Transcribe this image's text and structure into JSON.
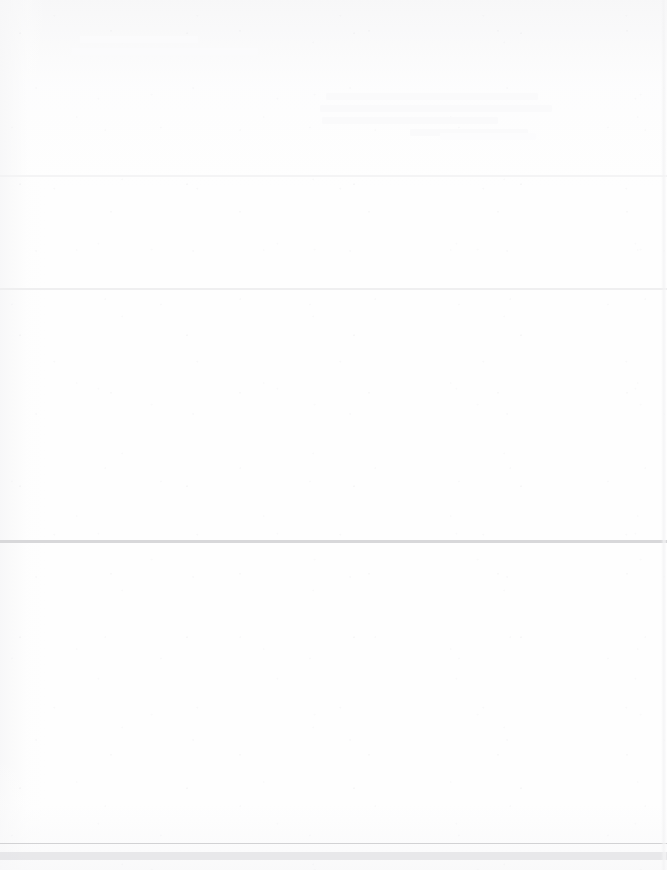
{
  "page": {
    "kind": "scanned-document-page",
    "width": 667,
    "height": 870,
    "background_color": "#fefefe",
    "legible_text": "",
    "note_label": "",
    "condition": "over-exposed scan; page content washed out to near-white and not legible"
  },
  "rules": [
    {
      "name": "rule-upper",
      "y": 175,
      "height": 2,
      "color": "#f2f2f3",
      "opacity": 0.85
    },
    {
      "name": "rule-mid-upper",
      "y": 288,
      "height": 2,
      "color": "#ededee",
      "opacity": 0.9
    },
    {
      "name": "rule-middle",
      "y": 540,
      "height": 3,
      "color": "#d8d8da",
      "opacity": 1
    },
    {
      "name": "rule-lower-hairline",
      "y": 843,
      "height": 1,
      "color": "#d2d2d4",
      "opacity": 1
    },
    {
      "name": "rule-footer-band",
      "y": 852,
      "height": 8,
      "color": "#e4e4e6",
      "opacity": 0.85
    }
  ],
  "ghost_blocks": [
    {
      "name": "ghost-marks-upper-left",
      "x": 72,
      "y": 36,
      "width": 198,
      "height": 34,
      "color": "#fbfbfc",
      "lines": [
        {
          "indent": 8,
          "width": 118
        },
        {
          "indent": 0,
          "width": 186
        }
      ]
    },
    {
      "name": "ghost-text-block-header",
      "x": 320,
      "y": 93,
      "width": 238,
      "height": 68,
      "color": "#fafafb",
      "lines": [
        {
          "indent": 6,
          "width": 212
        },
        {
          "indent": 0,
          "width": 232
        },
        {
          "indent": 2,
          "width": 176
        },
        {
          "indent": 90,
          "width": 118
        }
      ]
    },
    {
      "name": "ghost-marks-mid-right",
      "x": 440,
      "y": 133,
      "width": 112,
      "height": 16,
      "color": "#fcfcfd",
      "lines": [
        {
          "indent": 0,
          "width": 96
        }
      ]
    }
  ],
  "page_edge": {
    "name": "page-edge-right",
    "x": 661,
    "color": "#f3f3f4"
  }
}
